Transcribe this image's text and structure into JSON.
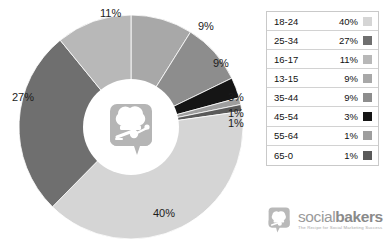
{
  "chart_data": {
    "type": "pie",
    "variant": "donut",
    "title": "",
    "subtitle": "",
    "xlabel": "",
    "ylabel": "",
    "legend_position": "right",
    "grid": false,
    "unit": "%",
    "categories": [
      "18-24",
      "25-34",
      "16-17",
      "13-15",
      "35-44",
      "45-54",
      "55-64",
      "65-0"
    ],
    "values": [
      40,
      27,
      11,
      9,
      9,
      3,
      1,
      1
    ],
    "labels": [
      "40%",
      "27%",
      "11%",
      "9%",
      "9%",
      "3%",
      "1%",
      "1%"
    ],
    "colors": [
      "#d5d5d5",
      "#6f6f6f",
      "#b8b8b8",
      "#a8a8a8",
      "#8d8d8d",
      "#151515",
      "#9e9e9e",
      "#5a5a5a"
    ],
    "slices": [
      {
        "label": "13-15",
        "value": 9,
        "display": "9%",
        "color": "#a8a8a8"
      },
      {
        "label": "35-44",
        "value": 9,
        "display": "9%",
        "color": "#8d8d8d"
      },
      {
        "label": "45-54",
        "value": 3,
        "display": "3%",
        "color": "#151515"
      },
      {
        "label": "55-64",
        "value": 1,
        "display": "1%",
        "color": "#9e9e9e"
      },
      {
        "label": "65-0",
        "value": 1,
        "display": "1%",
        "color": "#5a5a5a"
      },
      {
        "label": "18-24",
        "value": 40,
        "display": "40%",
        "color": "#d5d5d5"
      },
      {
        "label": "25-34",
        "value": 27,
        "display": "27%",
        "color": "#6f6f6f"
      },
      {
        "label": "16-17",
        "value": 11,
        "display": "11%",
        "color": "#b8b8b8"
      }
    ],
    "slice_label_positions": [
      {
        "display": "9%",
        "x": 198,
        "y": 20
      },
      {
        "display": "9%",
        "x": 213,
        "y": 57
      },
      {
        "display": "3%",
        "x": 228,
        "y": 91
      },
      {
        "display": "1%",
        "x": 228,
        "y": 107
      },
      {
        "display": "1%",
        "x": 228,
        "y": 117
      },
      {
        "display": "40%",
        "x": 153,
        "y": 207
      },
      {
        "display": "27%",
        "x": 12,
        "y": 91
      },
      {
        "display": "11%",
        "x": 100,
        "y": 7
      }
    ]
  },
  "legend": {
    "rows": [
      {
        "label": "18-24",
        "value": "40%",
        "color": "#d5d5d5"
      },
      {
        "label": "25-34",
        "value": "27%",
        "color": "#6f6f6f"
      },
      {
        "label": "16-17",
        "value": "11%",
        "color": "#b8b8b8"
      },
      {
        "label": "13-15",
        "value": "9%",
        "color": "#a8a8a8"
      },
      {
        "label": "35-44",
        "value": "9%",
        "color": "#8d8d8d"
      },
      {
        "label": "45-54",
        "value": "3%",
        "color": "#151515"
      },
      {
        "label": "55-64",
        "value": "1%",
        "color": "#9e9e9e"
      },
      {
        "label": "65-0",
        "value": "1%",
        "color": "#5a5a5a"
      }
    ]
  },
  "brand": {
    "name_light": "social",
    "name_bold": "bakers",
    "tagline": "The Recipe for Social Marketing Success",
    "mark_icon": "socialbakers-chef-hat-speech-bubble-icon"
  },
  "center": {
    "logo_icon": "socialbakers-chef-hat-speech-bubble-icon"
  }
}
